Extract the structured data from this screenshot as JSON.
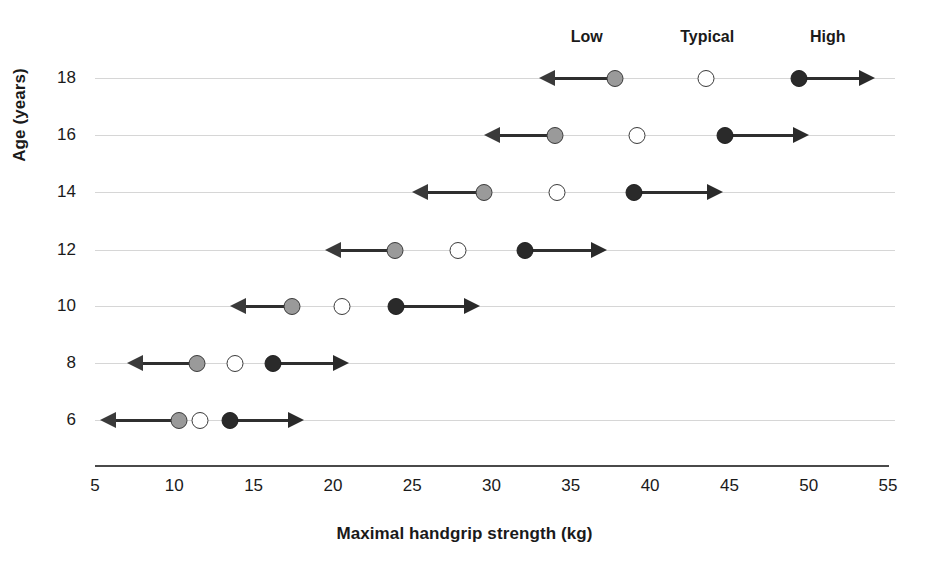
{
  "chart_data": {
    "type": "scatter",
    "title": "",
    "xlabel": "Maximal handgrip strength (kg)",
    "ylabel": "Age (years)",
    "xlim": [
      5,
      55
    ],
    "xticks": [
      5,
      10,
      15,
      20,
      25,
      30,
      35,
      40,
      45,
      50,
      55
    ],
    "yticks": [
      18,
      16,
      14,
      12,
      10,
      8,
      6
    ],
    "grid": true,
    "legend_position": "top",
    "legend": [
      "Low",
      "Typical",
      "High"
    ],
    "categories": [
      18,
      16,
      14,
      12,
      10,
      8,
      6
    ],
    "series": [
      {
        "name": "Low",
        "values": [
          37.8,
          34.0,
          29.5,
          23.9,
          17.4,
          11.4,
          10.3
        ]
      },
      {
        "name": "Typical",
        "values": [
          43.5,
          39.2,
          34.1,
          27.9,
          20.6,
          13.8,
          11.6
        ]
      },
      {
        "name": "High",
        "values": [
          49.4,
          44.7,
          39.0,
          32.1,
          24.0,
          16.2,
          13.5
        ]
      }
    ],
    "arrow_low_end": [
      33.0,
      29.5,
      25.0,
      19.5,
      13.5,
      7.0,
      5.3
    ],
    "arrow_high_end": [
      54.2,
      50.0,
      44.6,
      37.3,
      29.3,
      21.0,
      18.2
    ],
    "rows": [
      {
        "age": "18",
        "low": 37.8,
        "typical": 43.5,
        "high": 49.4,
        "low_arrow_to": 33.0,
        "high_arrow_to": 54.2
      },
      {
        "age": "16",
        "low": 34.0,
        "typical": 39.2,
        "high": 44.7,
        "low_arrow_to": 29.5,
        "high_arrow_to": 50.0
      },
      {
        "age": "14",
        "low": 29.5,
        "typical": 34.1,
        "high": 39.0,
        "low_arrow_to": 25.0,
        "high_arrow_to": 44.6
      },
      {
        "age": "12",
        "low": 23.9,
        "typical": 27.9,
        "high": 32.1,
        "low_arrow_to": 19.5,
        "high_arrow_to": 37.3
      },
      {
        "age": "10",
        "low": 17.4,
        "typical": 20.6,
        "high": 24.0,
        "low_arrow_to": 13.5,
        "high_arrow_to": 29.3
      },
      {
        "age": "8",
        "low": 11.4,
        "typical": 13.8,
        "high": 16.2,
        "low_arrow_to": 7.0,
        "high_arrow_to": 21.0
      },
      {
        "age": "6",
        "low": 10.3,
        "typical": 11.6,
        "high": 13.5,
        "low_arrow_to": 5.3,
        "high_arrow_to": 18.2
      }
    ]
  },
  "axes": {
    "x_title": "Maximal handgrip strength (kg)",
    "y_title": "Age (years)",
    "x_tick_labels": [
      "5",
      "10",
      "15",
      "20",
      "25",
      "30",
      "35",
      "40",
      "45",
      "50",
      "55"
    ],
    "y_tick_labels": [
      "18",
      "16",
      "14",
      "12",
      "10",
      "8",
      "6"
    ]
  },
  "headers": [
    {
      "label": "Low",
      "value": 36.0
    },
    {
      "label": "Typical",
      "value": 43.6
    },
    {
      "label": "High",
      "value": 51.2
    }
  ],
  "colors": {
    "low_marker": "#9a9a9a",
    "typical_marker": "#ffffff",
    "high_marker": "#2a2a2a",
    "arrow": "#2f2f2f",
    "gridline": "#cfcfcf",
    "axis": "#4a4a4a",
    "text": "#1a1a1a",
    "background": "#ffffff"
  }
}
